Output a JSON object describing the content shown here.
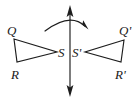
{
  "figure": {
    "background_color": "#ffffff",
    "ink_color": "#1d1d1d",
    "width": 140,
    "height": 101
  },
  "labels": {
    "q": "Q",
    "r": "R",
    "s": "S",
    "q_prime": "Q'",
    "r_prime": "R'",
    "s_prime": "S'"
  },
  "shapes": {
    "left_triangle": {
      "name": "triangle-QRS",
      "vertices": [
        {
          "label": "Q",
          "x": 14,
          "y": 39
        },
        {
          "label": "S",
          "x": 57,
          "y": 52
        },
        {
          "label": "R",
          "x": 17,
          "y": 62
        }
      ],
      "points": "14,39 57,52 17,62"
    },
    "right_triangle": {
      "name": "triangle-Q-prime-R-prime-S-prime",
      "vertices": [
        {
          "label": "Q'",
          "x": 124,
          "y": 40
        },
        {
          "label": "S'",
          "x": 85,
          "y": 52
        },
        {
          "label": "R'",
          "x": 121,
          "y": 62
        }
      ],
      "points": "124,40 85,52 121,62"
    },
    "axis": {
      "name": "axis-of-reflection",
      "x": 70,
      "y_top": 14,
      "y_bottom": 89,
      "arrowheads": "both"
    },
    "rotation_arc": {
      "name": "rotation-arc",
      "path": "M 45 31 Q 70 12 85 26",
      "arrowhead_at": {
        "x": 86,
        "y": 27
      },
      "direction": "clockwise"
    }
  },
  "label_positions": {
    "q": {
      "x": 7,
      "y": 35
    },
    "r": {
      "x": 11,
      "y": 79
    },
    "s": {
      "x": 58,
      "y": 57
    },
    "s_prime": {
      "x": 72,
      "y": 57
    },
    "q_prime": {
      "x": 120,
      "y": 35
    },
    "r_prime": {
      "x": 116,
      "y": 79
    }
  }
}
